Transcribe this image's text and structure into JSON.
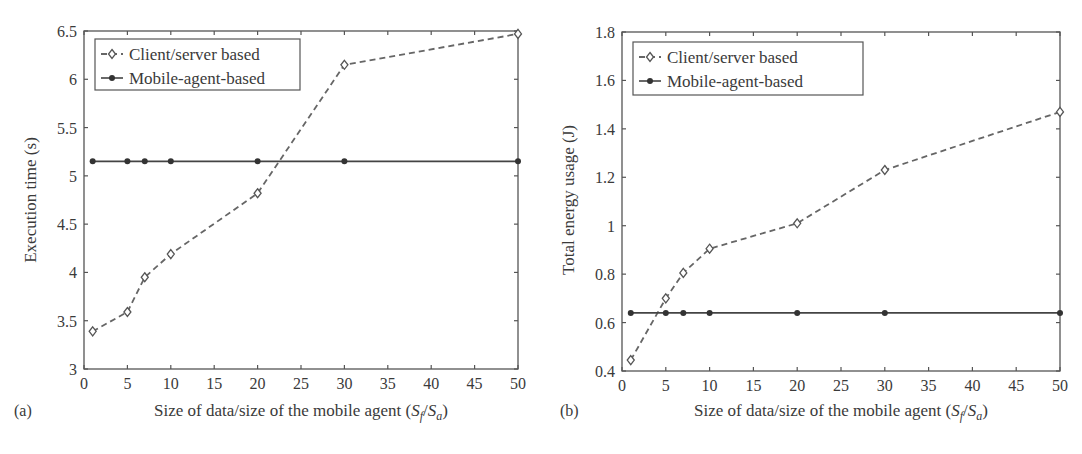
{
  "chart_data": [
    {
      "type": "line",
      "panel_label": "(a)",
      "title": "",
      "xlabel": "Size of data/size of the mobile agent (S_f/S_a)",
      "xlabel_parts": {
        "prefix": "Size of data/size of the mobile agent (",
        "s1": "S",
        "sub1": "f",
        "slash": "/",
        "s2": "S",
        "sub2": "a",
        "suffix": ")"
      },
      "ylabel": "Execution time (s)",
      "xlim": [
        0,
        50
      ],
      "ylim": [
        3,
        6.5
      ],
      "xticks": [
        "0",
        "5",
        "10",
        "15",
        "20",
        "25",
        "30",
        "35",
        "40",
        "45",
        "50"
      ],
      "yticks": [
        "3",
        "3.5",
        "4",
        "4.5",
        "5",
        "5.5",
        "6",
        "6.5"
      ],
      "grid": false,
      "legend_position": "upper left",
      "x": [
        1,
        5,
        7,
        10,
        20,
        30,
        50
      ],
      "series": [
        {
          "name": "Client/server based",
          "marker": "diamond",
          "linestyle": "dashed",
          "values": [
            3.39,
            3.59,
            3.95,
            4.19,
            4.82,
            6.15,
            6.47
          ]
        },
        {
          "name": "Mobile-agent-based",
          "marker": "asterisk",
          "linestyle": "solid",
          "values": [
            5.15,
            5.15,
            5.15,
            5.15,
            5.15,
            5.15,
            5.15
          ]
        }
      ]
    },
    {
      "type": "line",
      "panel_label": "(b)",
      "title": "",
      "xlabel": "Size of data/size of the mobile agent (S_f/S_a)",
      "xlabel_parts": {
        "prefix": "Size of data/size of the mobile agent (",
        "s1": "S",
        "sub1": "f",
        "slash": "/",
        "s2": "S",
        "sub2": "a",
        "suffix": ")"
      },
      "ylabel": "Total energy usage (J)",
      "xlim": [
        0,
        50
      ],
      "ylim": [
        0.4,
        1.8
      ],
      "xticks": [
        "0",
        "5",
        "10",
        "15",
        "20",
        "25",
        "30",
        "35",
        "40",
        "45",
        "50"
      ],
      "yticks": [
        "0.4",
        "0.6",
        "0.8",
        "1",
        "1.2",
        "1.4",
        "1.6",
        "1.8"
      ],
      "grid": false,
      "legend_position": "upper left",
      "x": [
        1,
        5,
        7,
        10,
        20,
        30,
        50
      ],
      "series": [
        {
          "name": "Client/server based",
          "marker": "diamond",
          "linestyle": "dashed",
          "values": [
            0.445,
            0.7,
            0.805,
            0.905,
            1.01,
            1.23,
            1.47
          ]
        },
        {
          "name": "Mobile-agent-based",
          "marker": "asterisk",
          "linestyle": "solid",
          "values": [
            0.64,
            0.64,
            0.64,
            0.64,
            0.64,
            0.64,
            0.64
          ]
        }
      ]
    }
  ]
}
